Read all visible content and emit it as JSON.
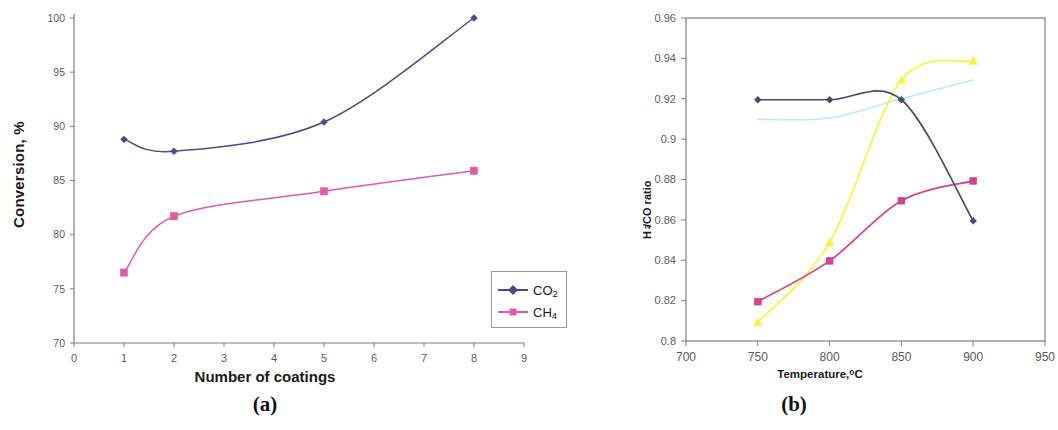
{
  "figure": {
    "panel_a_caption": "(a)",
    "panel_b_caption": "(b)"
  },
  "colors": {
    "co2_blue": "#4a4a8c",
    "ch4_pink": "#e45ba5",
    "coatings8_navy": "#4a4a6e",
    "coating1_magenta": "#d4418e",
    "coatings5_yellow": "#f9f43a",
    "coatings2_cyan": "#b6ecf5",
    "axis_gray": "#7f7f7f",
    "tick_text": "#5c5c5c"
  },
  "chart_data": [
    {
      "type": "line",
      "panel": "a",
      "title": "",
      "xlabel": "Number of coatings",
      "ylabel": "Conversion, %",
      "xlim": [
        0,
        9
      ],
      "ylim": [
        70,
        100
      ],
      "xticks": [
        0,
        1,
        2,
        3,
        4,
        5,
        6,
        7,
        8,
        9
      ],
      "xtick_labels": [
        "0",
        "1",
        "2",
        "3",
        "4",
        "5",
        "6",
        "7",
        "8",
        "9"
      ],
      "yticks": [
        70,
        75,
        80,
        85,
        90,
        95,
        100
      ],
      "ytick_labels": [
        "70",
        "75",
        "80",
        "85",
        "90",
        "95",
        "100"
      ],
      "grid": false,
      "legend_position": "bottom-right",
      "x": [
        1,
        2,
        5,
        8
      ],
      "series": [
        {
          "name": "CO2",
          "label_html": "CO<sub>2</sub>",
          "marker": "diamond",
          "color": "#4a4a8c",
          "values": [
            88.8,
            87.7,
            90.4,
            100.0
          ]
        },
        {
          "name": "CH4",
          "label_html": "CH<sub>4</sub>",
          "marker": "square",
          "color": "#e45ba5",
          "values": [
            76.5,
            81.7,
            84.0,
            85.9
          ]
        }
      ]
    },
    {
      "type": "line",
      "panel": "b",
      "title": "",
      "xlabel": "Temperature,°C",
      "ylabel": "H2/CO ratio",
      "ylabel_html": "H<sub>2</sub>/CO ratio",
      "xlim": [
        700,
        950
      ],
      "ylim": [
        0.8,
        0.96
      ],
      "xticks": [
        700,
        750,
        800,
        850,
        900,
        950
      ],
      "xtick_labels": [
        "700",
        "750",
        "800",
        "850",
        "900",
        "950"
      ],
      "yticks": [
        0.8,
        0.82,
        0.84,
        0.86,
        0.88,
        0.9,
        0.92,
        0.94,
        0.96
      ],
      "ytick_labels": [
        "0.8",
        "0.82",
        "0.84",
        "0.86",
        "0.88",
        "0.9",
        "0.92",
        "0.94",
        "0.96"
      ],
      "grid": false,
      "legend_position": "bottom-right",
      "x": [
        750,
        800,
        850,
        900
      ],
      "series": [
        {
          "name": "8 coatings",
          "label": "8 coatings",
          "marker": "diamond",
          "color": "#4a4a6e",
          "values": [
            0.9195,
            0.9195,
            0.9195,
            0.8595
          ]
        },
        {
          "name": "1 coating",
          "label": "1coating",
          "marker": "square",
          "color": "#d4418e",
          "values": [
            0.8195,
            0.8397,
            0.8695,
            0.8793
          ]
        },
        {
          "name": "5 coatings",
          "label": "5 coatings",
          "marker": "triangle",
          "color": "#f9f43a",
          "values": [
            0.8092,
            0.8487,
            0.9293,
            0.9387
          ]
        },
        {
          "name": "2 coatings",
          "label": "2 coatings",
          "marker": "none",
          "color": "#b6ecf5",
          "values": [
            0.9098,
            0.9105,
            0.92,
            0.9293
          ]
        }
      ]
    }
  ]
}
